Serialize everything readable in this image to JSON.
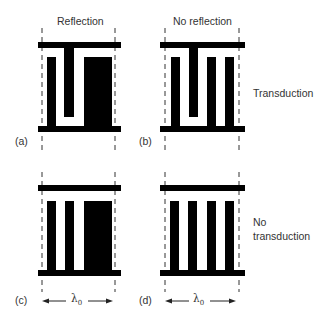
{
  "headers": {
    "left": "Reflection",
    "right": "No reflection"
  },
  "row_labels": {
    "top": "Transduction",
    "bottom_line1": "No",
    "bottom_line2": "transduction"
  },
  "panels": [
    {
      "id": "a",
      "label": "(a)",
      "description": "Reflection + transduction: one top-connected finger, narrow + wide bottom-connected electrodes"
    },
    {
      "id": "b",
      "label": "(b)",
      "description": "No reflection + transduction: one top-connected finger, three bottom-connected fingers"
    },
    {
      "id": "c",
      "label": "(c)",
      "description": "Reflection + no transduction: all electrodes bottom-connected (narrow, narrow, wide)"
    },
    {
      "id": "d",
      "label": "(d)",
      "description": "No reflection + no transduction: four equal bottom-connected fingers"
    }
  ],
  "wavelength": {
    "symbol": "λ",
    "subscript": "0"
  },
  "colors": {
    "electrode": "#000000",
    "dash": "#333333",
    "background": "#ffffff"
  }
}
